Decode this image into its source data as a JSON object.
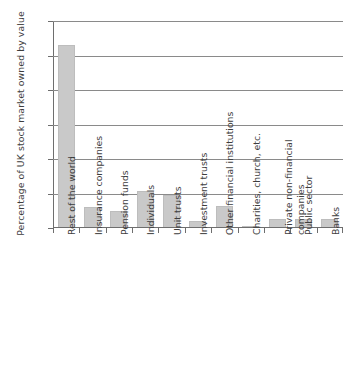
{
  "chart_data": {
    "type": "bar",
    "title": "",
    "xlabel": "",
    "ylabel": "Percentage of UK stock market owned by value",
    "ylim": [
      0,
      60
    ],
    "yticks": [
      0,
      10,
      20,
      30,
      40,
      50,
      60
    ],
    "grid": true,
    "legend": false,
    "bar_color": "#c9c9c9",
    "axis_color": "#6e6e6e",
    "categories": [
      "Rest of the world",
      "Insurance companies",
      "Pension funds",
      "Individuals",
      "Unit trusts",
      "Investment trusts",
      "Other financial institutions",
      "Charities, church, etc.",
      "Private non-financial\ncompanies",
      "Public sector",
      "Banks"
    ],
    "values": [
      53,
      6.1,
      4.8,
      10.8,
      9.5,
      1.9,
      6.3,
      0.7,
      2.5,
      2.5,
      2.5
    ]
  }
}
